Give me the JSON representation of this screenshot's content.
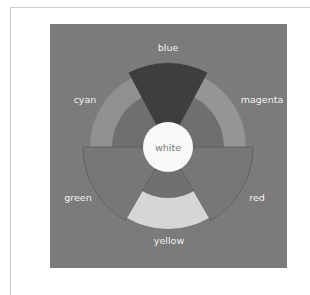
{
  "diagram": {
    "center_label": "white",
    "segments": [
      {
        "label": "blue",
        "type": "sector",
        "start": -28,
        "end": 28,
        "outer": 84,
        "fill": "#3e3e3e"
      },
      {
        "label": "magenta",
        "type": "ring",
        "start": 28,
        "end": 90,
        "outer": 78,
        "inner": 56,
        "fill": "#959595"
      },
      {
        "label": "red",
        "type": "sector",
        "start": 90,
        "end": 150,
        "outer": 85,
        "fill": "#777777"
      },
      {
        "label": "yellow",
        "type": "ring",
        "start": 150,
        "end": 210,
        "outer": 82,
        "inner": 51,
        "fill": "#d6d6d6"
      },
      {
        "label": "green",
        "type": "sector",
        "start": 210,
        "end": 270,
        "outer": 85,
        "fill": "#777777"
      },
      {
        "label": "cyan",
        "type": "ring",
        "start": 270,
        "end": 332,
        "outer": 78,
        "inner": 56,
        "fill": "#909090"
      }
    ],
    "labels": {
      "blue": "blue",
      "magenta": "magenta",
      "red": "red",
      "yellow": "yellow",
      "green": "green",
      "cyan": "cyan",
      "white": "white"
    },
    "colors": {
      "panel": "#7b7b7b",
      "inner_disc": "#6f6f6f",
      "center": "#f8f8f8"
    }
  }
}
